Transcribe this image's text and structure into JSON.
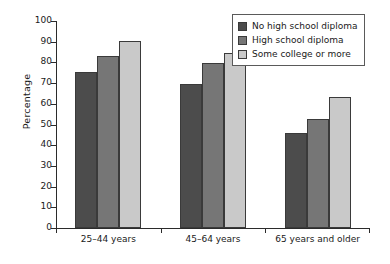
{
  "chart_data": {
    "type": "bar",
    "title": "",
    "xlabel": "",
    "ylabel": "Percentage",
    "ylim": [
      0,
      100
    ],
    "yticks": [
      0,
      10,
      20,
      30,
      40,
      50,
      60,
      70,
      80,
      90,
      100
    ],
    "grid": false,
    "legend_position": "top-right",
    "categories": [
      "25–44 years",
      "45–64 years",
      "65 years and older"
    ],
    "series": [
      {
        "name": "No high school diploma",
        "color": "#4c4c4c",
        "values": [
          75.5,
          69.5,
          46
        ]
      },
      {
        "name": "High school diploma",
        "color": "#767676",
        "values": [
          83,
          79.5,
          52.5
        ]
      },
      {
        "name": "Some college or more",
        "color": "#c9c9c9",
        "values": [
          90.5,
          84.5,
          63.5
        ]
      }
    ]
  },
  "axis": {
    "y_title": "Percentage",
    "tick_labels": [
      "0",
      "10",
      "20",
      "30",
      "40",
      "50",
      "60",
      "70",
      "80",
      "90",
      "100"
    ]
  },
  "legend": {
    "items": [
      {
        "label": "No high school diploma",
        "color": "#4c4c4c"
      },
      {
        "label": "High school diploma",
        "color": "#767676"
      },
      {
        "label": "Some college or more",
        "color": "#c9c9c9"
      }
    ]
  }
}
